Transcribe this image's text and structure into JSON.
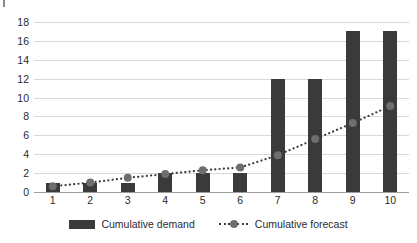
{
  "chart_data": {
    "type": "bar",
    "title": "",
    "subtitle": "",
    "xlabel": "",
    "ylabel": "",
    "categories": [
      "1",
      "2",
      "3",
      "4",
      "5",
      "6",
      "7",
      "8",
      "9",
      "10"
    ],
    "ylim": [
      0,
      18
    ],
    "ytick_step": 2,
    "yticks": [
      "18",
      "16",
      "14",
      "12",
      "10",
      "8",
      "6",
      "4",
      "2",
      "0"
    ],
    "grid": true,
    "legend_position": "bottom",
    "series": [
      {
        "name": "Cumulative demand",
        "type": "bar",
        "color": "#3a3a3a",
        "values": [
          1,
          1,
          1,
          2,
          2,
          2,
          12,
          12,
          17,
          17
        ]
      },
      {
        "name": "Cumulative forecast",
        "type": "line",
        "style": "dotted",
        "marker": "circle",
        "color": "#3a3a3a",
        "marker_color": "#6e6e6e",
        "values": [
          0.6,
          1.0,
          1.5,
          1.9,
          2.3,
          2.6,
          3.9,
          5.6,
          7.3,
          9.1
        ]
      }
    ]
  },
  "legend": {
    "items": [
      {
        "label": "Cumulative demand",
        "swatch": "bar-swatch"
      },
      {
        "label": "Cumulative forecast",
        "swatch": "dotted-line-swatch"
      }
    ]
  },
  "colors": {
    "bar": "#3a3a3a",
    "line": "#3a3a3a",
    "marker": "#6e6e6e",
    "gridline": "#d9d9d9",
    "axis": "#9d9d9d",
    "text": "#2b2b2b",
    "background": "#ffffff"
  }
}
